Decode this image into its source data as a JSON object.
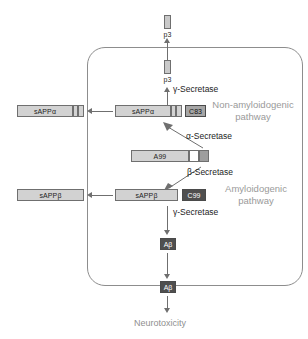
{
  "diagram": {
    "colors": {
      "membrane": "#8d8d8d",
      "light_segment": "#d2d2d2",
      "mid_segment": "#9e9e9e",
      "dark_segment": "#4f4f4f",
      "arrow": "#6f6f6f",
      "pathway_label": "#9a9a9a",
      "text": "#1d1d1d"
    },
    "products": {
      "p3_extracellular": "p3",
      "p3_intracellular": "p3",
      "sappa_extracellular": "sAPPα",
      "sappa_intracellular": "sAPPα",
      "c83": "C83",
      "app": "A99",
      "sappb_extracellular": "sAPPβ",
      "sappb_intracellular": "sAPPβ",
      "c99": "C99",
      "abeta_intracellular": "Aβ",
      "abeta_extracellular": "Aβ"
    },
    "enzymes": {
      "gamma_top": "γ-Secretase",
      "alpha": "α-Secretase",
      "beta": "β-Secretase",
      "gamma_bottom": "γ-Secretase"
    },
    "pathways": {
      "non_amyloidogenic_line1": "Non-amyloidogenic",
      "non_amyloidogenic_line2": "pathway",
      "amyloidogenic_line1": "Amyloidogenic",
      "amyloidogenic_line2": "pathway"
    },
    "outcome": "Neurotoxicity"
  }
}
